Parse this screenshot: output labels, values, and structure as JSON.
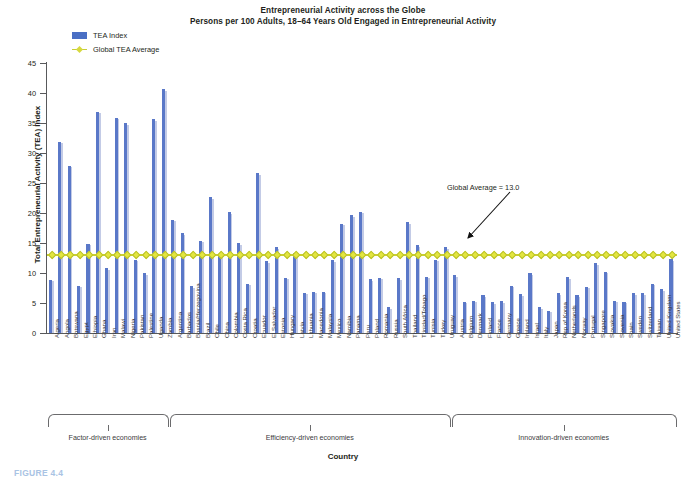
{
  "figure": {
    "title_line1": "Entrepreneurial Activity across the Globe",
    "title_line2": "Persons per 100 Adults, 18–64 Years Old Engaged in Entrepreneurial Activity",
    "footer_caption": "FIGURE 4.4"
  },
  "legend": {
    "items": [
      {
        "label": "TEA Index",
        "marker": "bar-swatch",
        "color": "#5a78c8"
      },
      {
        "label": "Global TEA Average",
        "marker": "line-diamond",
        "color": "#c9d02f"
      }
    ]
  },
  "annotation": {
    "text": "Global Average = 13.0",
    "arrow": "arrow-pointing-down-left"
  },
  "axes": {
    "y_title": "Total Entrepreneurial Activity (TEA) Index",
    "x_title": "Country",
    "y_ticks": [
      0,
      5,
      10,
      15,
      20,
      25,
      30,
      35,
      40,
      45
    ]
  },
  "groups": [
    {
      "label": "Factor-driven economies",
      "start": 0,
      "count": 13
    },
    {
      "label": "Efficiency-driven economies",
      "start": 13,
      "count": 30
    },
    {
      "label": "Innovation-driven economies",
      "start": 43,
      "count": 24
    }
  ],
  "chart_data": {
    "type": "bar",
    "title": "Entrepreneurial Activity across the Globe",
    "subtitle": "Persons per 100 Adults, 18–64 Years Old Engaged in Entrepreneurial Activity",
    "xlabel": "Country",
    "ylabel": "Total Entrepreneurial Activity (TEA) Index",
    "ylim": [
      0,
      45
    ],
    "yticks": [
      0,
      5,
      10,
      15,
      20,
      25,
      30,
      35,
      40,
      45
    ],
    "grid": false,
    "legend_position": "top-left-inside",
    "reference_line": {
      "name": "Global TEA Average",
      "value": 13.0,
      "color": "#c9d02f"
    },
    "categories": [
      "Algeria",
      "Angola",
      "Botswana",
      "Egypt",
      "Ethiopia",
      "Ghana",
      "Iran",
      "Malawi",
      "Nigeria",
      "Pakistan",
      "Palestine",
      "Uganda",
      "Zambia",
      "Argentina",
      "Barbados",
      "Bosnia/Herzegovina",
      "Brazil",
      "Chile",
      "China",
      "Colombia",
      "Costa Rica",
      "Croatia",
      "Ecuador",
      "El Salvador",
      "Estonia",
      "Hungary",
      "Latvia",
      "Lithuania",
      "Macedonia",
      "Malaysia",
      "Mexico",
      "Namibia",
      "Panama",
      "Peru",
      "Poland",
      "Romania",
      "Russia",
      "South Africa",
      "Thailand",
      "Trinidad/Tobago",
      "Tunisia",
      "Turkey",
      "Uruguay",
      "Austria",
      "Belgium",
      "Denmark",
      "Finland",
      "France",
      "Germany",
      "Greece",
      "Ireland",
      "Israel",
      "Italy",
      "Japan",
      "Rep of Korea",
      "Netherlands",
      "Norway",
      "Portugal",
      "Singapore",
      "Slovakia",
      "Slovenia",
      "Spain",
      "Sweden",
      "Switzerland",
      "Taiwan",
      "United Kingdom",
      "United States"
    ],
    "series": [
      {
        "name": "TEA Index",
        "color": "#5a78c8",
        "values": [
          8.9,
          31.9,
          27.9,
          7.9,
          14.9,
          36.9,
          10.8,
          35.9,
          35.0,
          12.2,
          10.0,
          35.6,
          40.6,
          18.9,
          16.6,
          7.8,
          15.4,
          22.6,
          12.8,
          20.1,
          15.0,
          8.2,
          26.6,
          12.0,
          14.3,
          9.2,
          13.4,
          6.7,
          6.9,
          6.9,
          12.1,
          18.2,
          19.6,
          20.2,
          9.0,
          9.2,
          4.3,
          9.1,
          18.5,
          14.6,
          9.4,
          12.2,
          14.3,
          9.6,
          5.2,
          5.4,
          6.3,
          5.1,
          5.3,
          7.9,
          6.5,
          10.0,
          4.3,
          3.7,
          6.6,
          9.3,
          6.3,
          7.7,
          11.6,
          10.2,
          5.4,
          5.2,
          6.6,
          6.6,
          8.2,
          7.3,
          12.3
        ]
      }
    ]
  }
}
